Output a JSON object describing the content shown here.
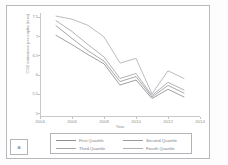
{
  "figure": {
    "panel_label": "a"
  },
  "chart_data": {
    "type": "line",
    "title": "",
    "xlabel": "Year",
    "ylabel": "CO2 emissions per capita (tons)",
    "xlim": [
      2004,
      2014
    ],
    "ylim": [
      4.9,
      7.6
    ],
    "xticks": [
      "2004",
      "2006",
      "2008",
      "2010",
      "2012",
      "2014"
    ],
    "yticks": [
      "7.5",
      "7",
      "6.5",
      "6",
      "5.5",
      "5"
    ],
    "grid": false,
    "legend_position": "bottom",
    "x": [
      2005,
      2006,
      2007,
      2008,
      2009,
      2010,
      2011,
      2012,
      2013
    ],
    "series": [
      {
        "name": "First Quartile",
        "color": "#8f8f94",
        "values": [
          7.02,
          6.78,
          6.52,
          6.28,
          5.73,
          5.86,
          5.38,
          5.62,
          5.42
        ]
      },
      {
        "name": "Second Quartile",
        "color": "#9a9a9f",
        "values": [
          7.27,
          6.94,
          6.62,
          6.35,
          5.82,
          5.95,
          5.42,
          5.72,
          5.52
        ]
      },
      {
        "name": "Third Quartile",
        "color": "#a5a5aa",
        "values": [
          7.4,
          7.12,
          6.78,
          6.46,
          5.9,
          6.03,
          5.46,
          5.8,
          5.6
        ]
      },
      {
        "name": "Fourth Quartile",
        "color": "#b0b0b5",
        "values": [
          7.52,
          7.44,
          7.28,
          6.98,
          6.3,
          6.42,
          5.5,
          6.1,
          5.9
        ]
      }
    ]
  },
  "axis": {
    "y_title": "CO2 emissions per capita (tons)",
    "x_title": "Year"
  },
  "legend": {
    "items": [
      {
        "label": "First Quartile"
      },
      {
        "label": "Second Quartile"
      },
      {
        "label": "Third Quartile"
      },
      {
        "label": "Fourth Quartile"
      }
    ]
  }
}
